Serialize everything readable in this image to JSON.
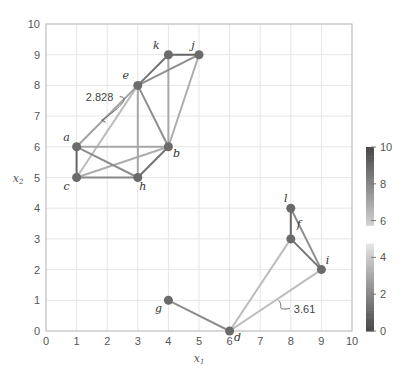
{
  "chart_data": {
    "type": "network-scatter",
    "title": "",
    "xlabel": "x1",
    "ylabel": "x2",
    "xlim": [
      0,
      10
    ],
    "ylim": [
      0,
      10
    ],
    "xticks": [
      0,
      1,
      2,
      3,
      4,
      5,
      6,
      7,
      8,
      9,
      10
    ],
    "yticks": [
      0,
      1,
      2,
      3,
      4,
      5,
      6,
      7,
      8,
      9,
      10
    ],
    "grid": true,
    "nodes": [
      {
        "id": "a",
        "x": 1,
        "y": 6,
        "label_dx": -10,
        "label_dy": -6
      },
      {
        "id": "b",
        "x": 4,
        "y": 6,
        "label_dx": 8,
        "label_dy": 10
      },
      {
        "id": "c",
        "x": 1,
        "y": 5,
        "label_dx": -10,
        "label_dy": 12
      },
      {
        "id": "d",
        "x": 6,
        "y": 0,
        "label_dx": 8,
        "label_dy": 10
      },
      {
        "id": "e",
        "x": 3,
        "y": 8,
        "label_dx": -12,
        "label_dy": -6
      },
      {
        "id": "f",
        "x": 8,
        "y": 3,
        "label_dx": 8,
        "label_dy": -11
      },
      {
        "id": "g",
        "x": 4,
        "y": 1,
        "label_dx": -10,
        "label_dy": 12
      },
      {
        "id": "h",
        "x": 3,
        "y": 5,
        "label_dx": 5,
        "label_dy": 12
      },
      {
        "id": "i",
        "x": 9,
        "y": 2,
        "label_dx": 6,
        "label_dy": -6
      },
      {
        "id": "j",
        "x": 5,
        "y": 9,
        "label_dx": -6,
        "label_dy": -6
      },
      {
        "id": "k",
        "x": 4,
        "y": 9,
        "label_dx": -12,
        "label_dy": -6
      },
      {
        "id": "l",
        "x": 8,
        "y": 4,
        "label_dx": -5,
        "label_dy": -6
      }
    ],
    "edges": [
      {
        "from": "a",
        "to": "c",
        "weight": 1.0
      },
      {
        "from": "c",
        "to": "h",
        "weight": 2.0
      },
      {
        "from": "a",
        "to": "h",
        "weight": 2.236
      },
      {
        "from": "a",
        "to": "b",
        "weight": 3.0
      },
      {
        "from": "c",
        "to": "b",
        "weight": 3.162
      },
      {
        "from": "c",
        "to": "e",
        "weight": 3.606
      },
      {
        "from": "a",
        "to": "e",
        "weight": 2.828
      },
      {
        "from": "e",
        "to": "h",
        "weight": 3.0
      },
      {
        "from": "e",
        "to": "b",
        "weight": 2.236
      },
      {
        "from": "h",
        "to": "b",
        "weight": 1.414
      },
      {
        "from": "e",
        "to": "k",
        "weight": 1.414
      },
      {
        "from": "k",
        "to": "j",
        "weight": 1.0
      },
      {
        "from": "e",
        "to": "j",
        "weight": 2.236
      },
      {
        "from": "k",
        "to": "b",
        "weight": 3.0
      },
      {
        "from": "j",
        "to": "b",
        "weight": 3.162
      },
      {
        "from": "l",
        "to": "f",
        "weight": 1.0
      },
      {
        "from": "f",
        "to": "i",
        "weight": 1.414
      },
      {
        "from": "l",
        "to": "i",
        "weight": 2.236
      },
      {
        "from": "d",
        "to": "f",
        "weight": 3.606
      },
      {
        "from": "d",
        "to": "i",
        "weight": 3.606
      },
      {
        "from": "g",
        "to": "d",
        "weight": 2.236
      }
    ],
    "annotations": [
      {
        "text": "2.828",
        "edge": "a-e",
        "text_x": 1.3,
        "text_y": 7.5,
        "anchor_x": 1.95,
        "anchor_y": 6.8
      },
      {
        "text": "3.61",
        "edge": "d-i",
        "text_x": 8.1,
        "text_y": 0.6,
        "anchor_x": 7.6,
        "anchor_y": 1.0
      }
    ],
    "colorbar": {
      "min": 0,
      "max": 10,
      "ticks": [
        0,
        2,
        4,
        6,
        8,
        10
      ],
      "gap": [
        4.8,
        5.8
      ],
      "colormap": "gray-diverging: dark at 0 and 10, light near 5"
    }
  },
  "colors": {
    "grid": "#e6e6e6",
    "axis": "#bbbbbb",
    "node": "#6b6b6b",
    "dark": "#4a4a4a",
    "light": "#f2f2f2"
  }
}
